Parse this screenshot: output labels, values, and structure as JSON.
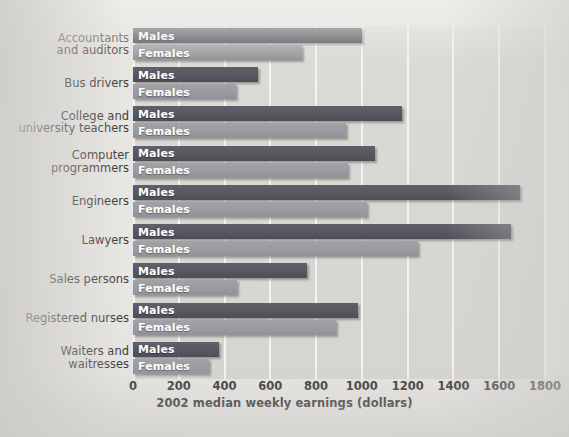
{
  "chart_data": {
    "type": "bar",
    "orientation": "horizontal",
    "title": "",
    "xlabel": "2002 median weekly earnings (dollars)",
    "ylabel": "",
    "xlim": [
      0,
      1800
    ],
    "xticks": [
      0,
      200,
      400,
      600,
      800,
      1000,
      1200,
      1400,
      1600,
      1800
    ],
    "xtick_labels": [
      "0",
      "200",
      "400",
      "600",
      "800",
      "1000",
      "1200",
      "1400",
      "1600",
      "1800"
    ],
    "grid": true,
    "legend": "inline-bar-labels",
    "categories": [
      "Accountants and auditors",
      "Bus drivers",
      "College and university teachers",
      "Computer programmers",
      "Engineers",
      "Lawyers",
      "Sales persons",
      "Registered nurses",
      "Waiters and waitresses"
    ],
    "category_lines": [
      [
        "Accountants",
        "and auditors"
      ],
      [
        "Bus drivers"
      ],
      [
        "College and",
        "university teachers"
      ],
      [
        "Computer",
        "programmers"
      ],
      [
        "Engineers"
      ],
      [
        "Lawyers"
      ],
      [
        "Sales persons"
      ],
      [
        "Registered nurses"
      ],
      [
        "Waiters and",
        "waitresses"
      ]
    ],
    "series": [
      {
        "name": "Males",
        "color": "#56565f",
        "values": [
          1000,
          548,
          1174,
          1059,
          1690,
          1653,
          760,
          985,
          377
        ]
      },
      {
        "name": "Females",
        "color": "#99999f",
        "values": [
          740,
          451,
          930,
          939,
          1022,
          1243,
          456,
          889,
          331
        ]
      }
    ]
  },
  "labels": {
    "males": "Males",
    "females": "Females"
  }
}
